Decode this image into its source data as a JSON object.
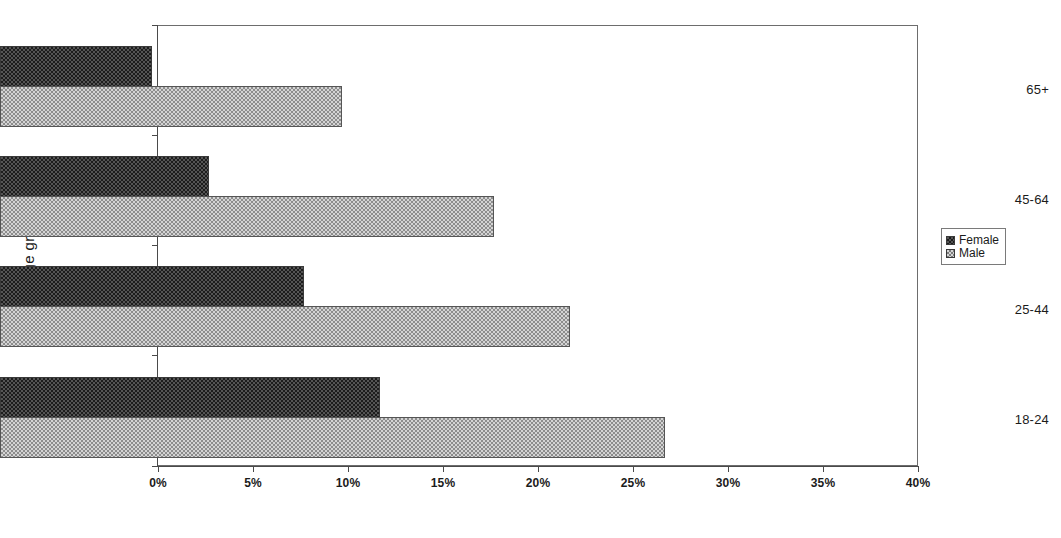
{
  "chart_data": {
    "type": "bar",
    "orientation": "horizontal",
    "title": "",
    "xlabel": "",
    "ylabel": "Age group",
    "categories": [
      "18-24",
      "25-44",
      "45-64",
      "65+"
    ],
    "series": [
      {
        "name": "Female",
        "values": [
          20,
          16,
          11,
          8
        ],
        "color": "#3a3a3a"
      },
      {
        "name": "Male",
        "values": [
          35,
          30,
          26,
          18
        ],
        "color": "#c0c0c0"
      }
    ],
    "xlim": [
      0,
      40
    ],
    "xticks": [
      0,
      5,
      10,
      15,
      20,
      25,
      30,
      35,
      40
    ],
    "xticklabels": [
      "0%",
      "5%",
      "10%",
      "15%",
      "20%",
      "25%",
      "30%",
      "35%",
      "40%"
    ],
    "grid": false,
    "legend_position": "right",
    "value_suffix": "%"
  },
  "legend": {
    "entries": [
      {
        "label": "Female",
        "swatch": "female-swatch-icon"
      },
      {
        "label": "Male",
        "swatch": "male-swatch-icon"
      }
    ]
  },
  "axes": {
    "y_title": "Age group",
    "category_labels": [
      "65+",
      "45-64",
      "25-44",
      "18-24"
    ],
    "x_tick_labels": [
      "0%",
      "5%",
      "10%",
      "15%",
      "20%",
      "25%",
      "30%",
      "35%",
      "40%"
    ]
  }
}
